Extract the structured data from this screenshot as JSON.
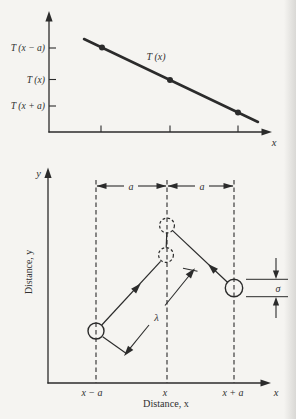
{
  "figure": {
    "top_graph": {
      "y_tick_labels": [
        "T (x − a)",
        "T (x)",
        "T (x + a)"
      ],
      "curve_label": "T (x)",
      "x_axis_label": "x"
    },
    "bottom_diagram": {
      "y_symbol": "y",
      "x_symbol": "x",
      "y_axis_caption": "Distance, y",
      "x_axis_caption": "Distance, x",
      "spacing_labels": [
        "a",
        "a"
      ],
      "free_path_label": "λ",
      "diameter_label": "σ",
      "x_tick_labels": [
        "x − a",
        "x",
        "x + a"
      ]
    },
    "colors": {
      "ink": "#2b2b2b",
      "background": "#f5f4f1"
    }
  }
}
